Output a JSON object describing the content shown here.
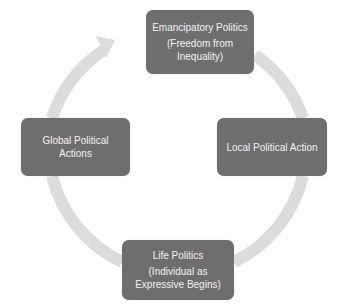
{
  "diagram": {
    "type": "cycle",
    "colors": {
      "node_fill": "#6e6e6e",
      "node_text": "#f2f2f2",
      "arrow": "#dcdcdc",
      "background": "#ffffff"
    },
    "nodes": [
      {
        "id": "top",
        "title": "Emancipatory Politics",
        "subtitle": "(Freedom from Inequality)"
      },
      {
        "id": "right",
        "title": "Local Political Action",
        "subtitle": ""
      },
      {
        "id": "bottom",
        "title": "Life Politics",
        "subtitle": "(Individual as Expressive Begins)"
      },
      {
        "id": "left",
        "title": "Global Political Actions",
        "subtitle": ""
      }
    ],
    "edges": [
      {
        "from": "left",
        "to": "top",
        "style": "arrow"
      },
      {
        "from": "top",
        "to": "right",
        "style": "arc"
      },
      {
        "from": "right",
        "to": "bottom",
        "style": "arc"
      },
      {
        "from": "bottom",
        "to": "left",
        "style": "arc"
      }
    ]
  }
}
